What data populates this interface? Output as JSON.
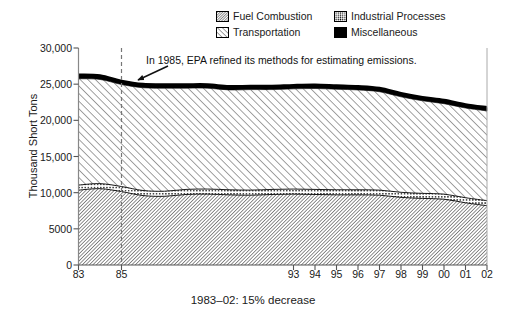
{
  "legend": {
    "entries": [
      {
        "label": "Fuel Combustion",
        "pattern": "dense-diagonal-hatch",
        "color": "#000000"
      },
      {
        "label": "Industrial Processes",
        "pattern": "dotted-stipple",
        "color": "#000000"
      },
      {
        "label": "Transportation",
        "pattern": "wide-diagonal-hatch",
        "color": "#000000"
      },
      {
        "label": "Miscellaneous",
        "pattern": "solid",
        "color": "#000000"
      }
    ]
  },
  "annotation": {
    "text": "In 1985, EPA refined its methods for estimating emissions.",
    "arrow": "arrow-pointing-down-left",
    "marker_year": 1985,
    "marker_style": "dashed-vertical-line"
  },
  "caption": "1983–02: 15% decrease",
  "chart_data": {
    "type": "area",
    "title": "",
    "subtitle": "",
    "xlabel": "",
    "ylabel": "Thousand Short Tons",
    "stacked": true,
    "grid": false,
    "legend_position": "top-right",
    "xlim": [
      1983,
      2002
    ],
    "ylim": [
      0,
      30000
    ],
    "yticks": [
      0,
      5000,
      10000,
      15000,
      20000,
      25000,
      30000
    ],
    "ytick_labels": [
      "0",
      "5000",
      "10,000",
      "15,000",
      "20,000",
      "25,000",
      "30,000"
    ],
    "x": [
      1983,
      1984,
      1985,
      1986,
      1987,
      1988,
      1989,
      1990,
      1991,
      1992,
      1993,
      1994,
      1995,
      1996,
      1997,
      1998,
      1999,
      2000,
      2001,
      2002
    ],
    "xtick_labels": [
      "83",
      "",
      "85",
      "",
      "",
      "",
      "",
      "",
      "",
      "",
      "93",
      "94",
      "95",
      "96",
      "97",
      "98",
      "99",
      "00",
      "01",
      "02"
    ],
    "visible_xtick_labels": [
      "83",
      "85",
      "93",
      "94",
      "95",
      "96",
      "97",
      "98",
      "99",
      "00",
      "01",
      "02"
    ],
    "series": [
      {
        "name": "Fuel Combustion",
        "values": [
          10350,
          10550,
          10150,
          9600,
          9500,
          9750,
          9800,
          9700,
          9650,
          9750,
          9800,
          9750,
          9700,
          9700,
          9650,
          9350,
          9200,
          9100,
          8600,
          8200
        ]
      },
      {
        "name": "Industrial Processes",
        "values": [
          700,
          700,
          700,
          700,
          700,
          700,
          700,
          700,
          700,
          700,
          700,
          700,
          700,
          700,
          700,
          700,
          700,
          700,
          700,
          700
        ]
      },
      {
        "name": "Transportation",
        "values": [
          14700,
          14400,
          14100,
          14200,
          14250,
          14000,
          13950,
          13800,
          13900,
          13800,
          13850,
          13950,
          13900,
          13800,
          13600,
          13200,
          12800,
          12500,
          12400,
          12400
        ]
      },
      {
        "name": "Miscellaneous",
        "values": [
          550,
          550,
          500,
          500,
          500,
          500,
          500,
          500,
          500,
          500,
          500,
          500,
          500,
          500,
          500,
          500,
          500,
          500,
          500,
          500
        ]
      }
    ],
    "totals": [
      26300,
      26200,
      25450,
      25000,
      24950,
      24950,
      24950,
      24700,
      24750,
      24750,
      24850,
      24900,
      24800,
      24700,
      24450,
      23750,
      23200,
      22800,
      22200,
      21800
    ],
    "annotations": [
      {
        "text": "In 1985, EPA refined its methods for estimating emissions.",
        "x": 1985
      }
    ]
  }
}
